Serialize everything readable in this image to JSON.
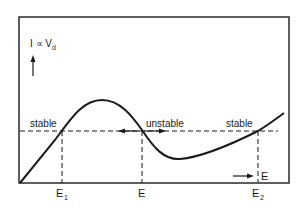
{
  "diagram": {
    "y_axis_label": "I ∝ V",
    "y_axis_subscript": "d",
    "x_axis_label": "E",
    "x_ticks": [
      {
        "label": "E",
        "subscript": "1"
      },
      {
        "label": "E",
        "subscript": ""
      },
      {
        "label": "E",
        "subscript": "2"
      }
    ],
    "annotations": [
      {
        "text": "stable"
      },
      {
        "text": "unstable"
      },
      {
        "text": "stable"
      }
    ],
    "colors": {
      "line": "#1a1a1a",
      "background": "#ffffff"
    }
  }
}
